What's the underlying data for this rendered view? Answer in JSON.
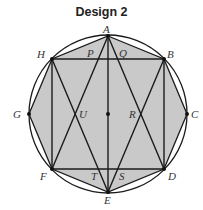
{
  "title": "Design 2",
  "colors": {
    "fill": "#c9c9c9",
    "stroke": "#1a1a1a",
    "background": "#ffffff"
  },
  "circle": {
    "cx": 108,
    "cy": 114,
    "r": 79
  },
  "vertices": {
    "A": {
      "x": 108,
      "y": 36
    },
    "B": {
      "x": 164,
      "y": 59
    },
    "C": {
      "x": 187,
      "y": 114
    },
    "D": {
      "x": 164,
      "y": 169
    },
    "E": {
      "x": 108,
      "y": 192
    },
    "F": {
      "x": 52,
      "y": 169
    },
    "G": {
      "x": 29,
      "y": 114
    },
    "H": {
      "x": 52,
      "y": 59
    }
  },
  "labels": {
    "A": "A",
    "B": "B",
    "C": "C",
    "D": "D",
    "E": "E",
    "F": "F",
    "G": "G",
    "H": "H",
    "P": "P",
    "Q": "Q",
    "R": "R",
    "S": "S",
    "T": "T",
    "U": "U"
  },
  "segments": [
    [
      "H",
      "B"
    ],
    [
      "F",
      "D"
    ],
    [
      "H",
      "F"
    ],
    [
      "B",
      "D"
    ],
    [
      "A",
      "E"
    ],
    [
      "A",
      "F"
    ],
    [
      "A",
      "D"
    ],
    [
      "E",
      "H"
    ],
    [
      "E",
      "B"
    ]
  ],
  "center_dot": {
    "x": 108,
    "y": 114
  }
}
